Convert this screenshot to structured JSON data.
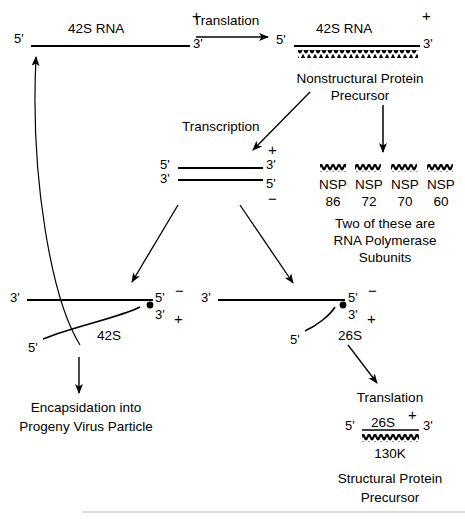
{
  "diagram": {
    "genome_top": {
      "five_prime": "5'",
      "three_prime": "3'",
      "name": "42S RNA",
      "polarity": "+"
    },
    "translation_step_1": {
      "label": "Translation"
    },
    "genome_translated": {
      "five_prime": "5'",
      "three_prime": "3'",
      "name": "42S RNA",
      "polarity": "+",
      "product_line1": "Nonstructural  Protein",
      "product_line2": "Precursor"
    },
    "nsp_products": {
      "items": [
        {
          "name": "NSP",
          "size": "86"
        },
        {
          "name": "NSP",
          "size": "72"
        },
        {
          "name": "NSP",
          "size": "70"
        },
        {
          "name": "NSP",
          "size": "60"
        }
      ],
      "note_line1": "Two of  these are",
      "note_line2": "RNA  Polymerase",
      "note_line3": "Subunits"
    },
    "transcription_step": {
      "label": "Transcription"
    },
    "replicative_form": {
      "top_left": "5'",
      "top_right": "3'",
      "bottom_left": "3'",
      "bottom_right": "5'",
      "plus_polarity": "+",
      "minus_polarity": "−"
    },
    "synthesis_42s": {
      "template_left": "3'",
      "template_right": "5'",
      "template_polarity": "−",
      "nascent_three_prime": "3'",
      "nascent_five_prime": "5'",
      "nascent_polarity": "+",
      "nascent_name": "42S"
    },
    "synthesis_26s": {
      "template_left": "3'",
      "template_right": "5'",
      "template_polarity": "−",
      "nascent_three_prime": "3'",
      "nascent_five_prime": "5'",
      "nascent_polarity": "+",
      "nascent_name": "26S"
    },
    "encapsidation": {
      "line1": "Encapsidation  into",
      "line2": "Progeny  Virus  Particle"
    },
    "translation_step_2": {
      "label": "Translation"
    },
    "mrna_26s": {
      "five_prime": "5'",
      "three_prime": "3'",
      "name": "26S",
      "polarity": "+",
      "protein_size": "130K",
      "product_line1": "Structural  Protein",
      "product_line2": "Precursor"
    }
  },
  "colors": {
    "ink": "#000000",
    "background": "#ffffff",
    "rule": "#b9b9b9"
  }
}
